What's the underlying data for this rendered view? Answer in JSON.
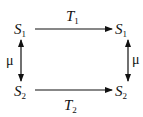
{
  "diagram": {
    "type": "commutative-diagram",
    "nodes": {
      "top_left": {
        "base": "S",
        "sub": "1"
      },
      "top_right": {
        "base": "S",
        "sub": "1"
      },
      "bottom_left": {
        "base": "S",
        "sub": "2"
      },
      "bottom_right": {
        "base": "S",
        "sub": "2"
      }
    },
    "edges": {
      "top": {
        "base": "T",
        "sub": "1",
        "direction": "right"
      },
      "bottom": {
        "base": "T",
        "sub": "2",
        "direction": "right"
      },
      "left": {
        "label": "μ",
        "direction": "bidirectional"
      },
      "right": {
        "label": "μ",
        "direction": "bidirectional"
      }
    }
  }
}
